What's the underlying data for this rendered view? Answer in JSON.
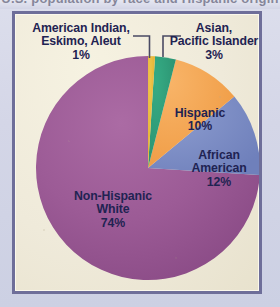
{
  "figure": {
    "frame_border_color": "#6e6e99",
    "page_background": "#d7d9e9",
    "panel_background": "#efeada",
    "label_text_color": "#1f2352",
    "clipped_title_above": "U.S. population by race and Hispanic origin"
  },
  "chart_data": {
    "type": "pie",
    "title": "",
    "subtitle": "",
    "xlabel": "",
    "ylabel": "",
    "legend_position": "none",
    "grid": false,
    "units": "percent",
    "total": 100,
    "categories": [
      "American Indian, Eskimo, Aleut",
      "Asian, Pacific Islander",
      "Hispanic",
      "African American",
      "Non-Hispanic White"
    ],
    "values": [
      1,
      3,
      10,
      12,
      74
    ],
    "colors": [
      "#e9b93c",
      "#2f9c79",
      "#f4a753",
      "#7d8ec6",
      "#9c5b96"
    ],
    "start_angle_deg": 0,
    "direction": "clockwise",
    "slices": [
      {
        "name": "American Indian, Eskimo, Aleut",
        "label_line1": "American Indian,",
        "label_line2": "Eskimo, Aleut",
        "percent_label": "1%",
        "value": 1,
        "color": "#e9b93c",
        "callout": true
      },
      {
        "name": "Asian, Pacific Islander",
        "label_line1": "Asian,",
        "label_line2": "Pacific Islander",
        "percent_label": "3%",
        "value": 3,
        "color": "#2f9c79",
        "callout": true
      },
      {
        "name": "Hispanic",
        "label_line1": "Hispanic",
        "label_line2": "",
        "percent_label": "10%",
        "value": 10,
        "color": "#f4a753",
        "callout": false
      },
      {
        "name": "African American",
        "label_line1": "African",
        "label_line2": "American",
        "percent_label": "12%",
        "value": 12,
        "color": "#7d8ec6",
        "callout": false
      },
      {
        "name": "Non-Hispanic White",
        "label_line1": "Non-Hispanic",
        "label_line2": "White",
        "percent_label": "74%",
        "value": 74,
        "color": "#9c5b96",
        "callout": false
      }
    ]
  }
}
